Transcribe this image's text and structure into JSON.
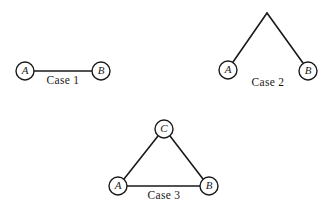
{
  "figure": {
    "type": "graph-diagram",
    "background_color": "#ffffff",
    "stroke_color": "#1a1a1a",
    "node_fill_color": "#ffffff",
    "width": 329,
    "height": 212
  },
  "cases": [
    {
      "id": "case-1",
      "label": "Case 1",
      "label_position": {
        "x": 63,
        "y": 81
      },
      "nodes": [
        {
          "id": "c1-a",
          "label": "A",
          "cx": 25,
          "cy": 71,
          "r": 9
        },
        {
          "id": "c1-b",
          "label": "B",
          "cx": 101,
          "cy": 71,
          "r": 9
        }
      ],
      "edges": [
        {
          "id": "c1-ab",
          "from": "A",
          "to": "B",
          "x1": 34,
          "y1": 71,
          "x2": 92,
          "y2": 71
        }
      ]
    },
    {
      "id": "case-2",
      "label": "Case 2",
      "label_position": {
        "x": 268,
        "y": 83
      },
      "nodes": [
        {
          "id": "c2-apex",
          "label": "",
          "cx": 267,
          "cy": 13,
          "r": 0
        },
        {
          "id": "c2-a",
          "label": "A",
          "cx": 228,
          "cy": 70,
          "r": 9
        },
        {
          "id": "c2-b",
          "label": "B",
          "cx": 308,
          "cy": 71,
          "r": 9
        }
      ],
      "edges": [
        {
          "id": "c2-apex-a",
          "from": "apex",
          "to": "A",
          "x1": 267,
          "y1": 13,
          "x2": 233,
          "y2": 62
        },
        {
          "id": "c2-apex-b",
          "from": "apex",
          "to": "B",
          "x1": 267,
          "y1": 13,
          "x2": 303,
          "y2": 63
        }
      ]
    },
    {
      "id": "case-3",
      "label": "Case 3",
      "label_position": {
        "x": 164,
        "y": 196
      },
      "nodes": [
        {
          "id": "c3-c",
          "label": "C",
          "cx": 164,
          "cy": 129,
          "r": 9
        },
        {
          "id": "c3-a",
          "label": "A",
          "cx": 118,
          "cy": 186,
          "r": 9
        },
        {
          "id": "c3-b",
          "label": "B",
          "cx": 209,
          "cy": 186,
          "r": 9
        }
      ],
      "edges": [
        {
          "id": "c3-ca",
          "from": "C",
          "to": "A",
          "x1": 158,
          "y1": 136,
          "x2": 124,
          "y2": 179
        },
        {
          "id": "c3-cb",
          "from": "C",
          "to": "B",
          "x1": 170,
          "y1": 136,
          "x2": 203,
          "y2": 179
        },
        {
          "id": "c3-ab",
          "from": "A",
          "to": "B",
          "x1": 127,
          "y1": 186,
          "x2": 200,
          "y2": 186
        }
      ]
    }
  ]
}
